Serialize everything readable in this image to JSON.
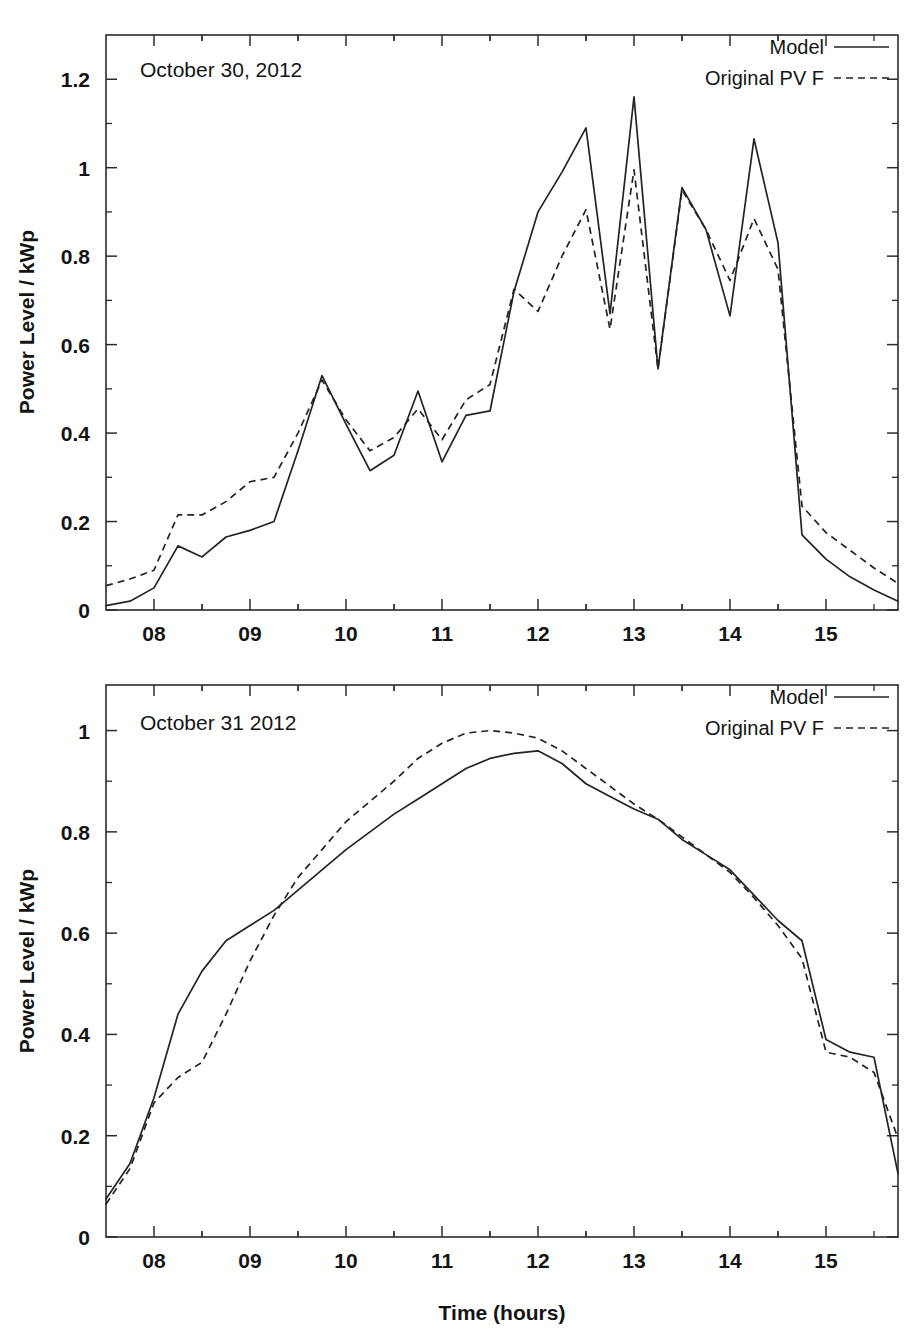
{
  "figure": {
    "xlabel": "Time (hours)",
    "ylabel": "Power Level / kWp"
  },
  "chart_data": [
    {
      "type": "line",
      "title": "October 30, 2012",
      "xlabel": "",
      "ylabel": "Power Level / kWp",
      "xlim": [
        7.5,
        15.75
      ],
      "ylim": [
        0,
        1.3
      ],
      "xticks": [
        "08",
        "09",
        "10",
        "11",
        "12",
        "13",
        "14",
        "15"
      ],
      "xtick_values": [
        8,
        9,
        10,
        11,
        12,
        13,
        14,
        15
      ],
      "yticks": [
        "0",
        "0.2",
        "0.4",
        "0.6",
        "0.8",
        "1",
        "1.2"
      ],
      "ytick_values": [
        0,
        0.2,
        0.4,
        0.6,
        0.8,
        1.0,
        1.2
      ],
      "grid": false,
      "legend_position": "top-right",
      "minor_ticks": true,
      "x": [
        7.5,
        7.75,
        8.0,
        8.25,
        8.5,
        8.75,
        9.0,
        9.25,
        9.5,
        9.75,
        10.0,
        10.25,
        10.5,
        10.75,
        11.0,
        11.25,
        11.5,
        11.75,
        12.0,
        12.25,
        12.5,
        12.75,
        13.0,
        13.25,
        13.5,
        13.75,
        14.0,
        14.25,
        14.5,
        14.75,
        15.0,
        15.25,
        15.5,
        15.75
      ],
      "series": [
        {
          "name": "Model",
          "style": "solid",
          "values": [
            0.01,
            0.02,
            0.05,
            0.145,
            0.12,
            0.165,
            0.18,
            0.2,
            0.36,
            0.53,
            0.42,
            0.315,
            0.35,
            0.495,
            0.335,
            0.44,
            0.45,
            0.72,
            0.9,
            0.99,
            1.09,
            0.67,
            1.16,
            0.545,
            0.955,
            0.86,
            0.665,
            1.065,
            0.83,
            0.17,
            0.115,
            0.075,
            0.045,
            0.02
          ]
        },
        {
          "name": "Original PV F",
          "style": "dashed",
          "values": [
            0.055,
            0.07,
            0.09,
            0.215,
            0.215,
            0.245,
            0.29,
            0.3,
            0.4,
            0.52,
            0.43,
            0.36,
            0.39,
            0.455,
            0.385,
            0.475,
            0.51,
            0.725,
            0.675,
            0.8,
            0.905,
            0.635,
            0.995,
            0.545,
            0.95,
            0.86,
            0.745,
            0.885,
            0.77,
            0.235,
            0.175,
            0.135,
            0.095,
            0.06
          ]
        }
      ]
    },
    {
      "type": "line",
      "title": "October 31 2012",
      "xlabel": "Time (hours)",
      "ylabel": "Power Level / kWp",
      "xlim": [
        7.5,
        15.75
      ],
      "ylim": [
        0,
        1.09
      ],
      "xticks": [
        "08",
        "09",
        "10",
        "11",
        "12",
        "13",
        "14",
        "15"
      ],
      "xtick_values": [
        8,
        9,
        10,
        11,
        12,
        13,
        14,
        15
      ],
      "yticks": [
        "0",
        "0.2",
        "0.4",
        "0.6",
        "0.8",
        "1"
      ],
      "ytick_values": [
        0,
        0.2,
        0.4,
        0.6,
        0.8,
        1.0
      ],
      "grid": false,
      "legend_position": "top-right",
      "minor_ticks": true,
      "x": [
        7.5,
        7.75,
        8.0,
        8.25,
        8.5,
        8.75,
        9.0,
        9.25,
        9.5,
        9.75,
        10.0,
        10.25,
        10.5,
        10.75,
        11.0,
        11.25,
        11.5,
        11.75,
        12.0,
        12.25,
        12.5,
        12.75,
        13.0,
        13.25,
        13.5,
        13.75,
        14.0,
        14.25,
        14.5,
        14.75,
        15.0,
        15.25,
        15.5,
        15.75
      ],
      "series": [
        {
          "name": "Model",
          "style": "solid",
          "values": [
            0.075,
            0.145,
            0.275,
            0.44,
            0.525,
            0.585,
            0.615,
            0.645,
            0.685,
            0.725,
            0.765,
            0.8,
            0.835,
            0.865,
            0.895,
            0.925,
            0.945,
            0.955,
            0.96,
            0.935,
            0.895,
            0.87,
            0.845,
            0.825,
            0.785,
            0.755,
            0.725,
            0.675,
            0.625,
            0.585,
            0.39,
            0.365,
            0.355,
            0.125
          ]
        },
        {
          "name": "Original PV F",
          "style": "dashed",
          "values": [
            0.065,
            0.135,
            0.265,
            0.315,
            0.345,
            0.44,
            0.545,
            0.635,
            0.71,
            0.765,
            0.82,
            0.86,
            0.9,
            0.945,
            0.975,
            0.995,
            1.0,
            0.995,
            0.985,
            0.96,
            0.925,
            0.89,
            0.855,
            0.825,
            0.79,
            0.755,
            0.72,
            0.67,
            0.615,
            0.55,
            0.365,
            0.355,
            0.325,
            0.195
          ]
        }
      ]
    }
  ],
  "legend": {
    "entries": [
      {
        "label": "Model",
        "style": "solid"
      },
      {
        "label": "Original PV F",
        "style": "dashed"
      }
    ]
  }
}
